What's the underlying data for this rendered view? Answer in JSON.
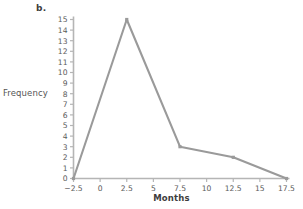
{
  "panel": {
    "label": "b."
  },
  "chart_data": {
    "type": "line",
    "title": "",
    "subtitle": "",
    "xlabel": "Months",
    "ylabel": "Frequency",
    "x": [
      -2.5,
      2.5,
      7.5,
      12.5,
      17.5
    ],
    "values": [
      0,
      15,
      3,
      2,
      0
    ],
    "series": [
      {
        "name": "Frequency",
        "x": [
          -2.5,
          2.5,
          7.5,
          12.5,
          17.5
        ],
        "values": [
          0,
          15,
          3,
          2,
          0
        ]
      }
    ],
    "xlim": [
      -2.5,
      17.5
    ],
    "ylim": [
      0,
      15
    ],
    "xticks": [
      -2.5,
      0,
      2.5,
      5,
      7.5,
      10,
      12.5,
      15,
      17.5
    ],
    "xtick_labels": [
      "−2.5",
      "0",
      "2.5",
      "5",
      "7.5",
      "10",
      "12.5",
      "15",
      "17.5"
    ],
    "yticks": [
      0,
      1,
      2,
      3,
      4,
      5,
      6,
      7,
      8,
      9,
      10,
      11,
      12,
      13,
      14,
      15
    ],
    "ytick_labels": [
      "0",
      "1",
      "2",
      "3",
      "4",
      "5",
      "6",
      "7",
      "8",
      "9",
      "10",
      "11",
      "12",
      "13",
      "14",
      "15"
    ],
    "grid": false,
    "legend": false,
    "legend_position": "none",
    "markers": true,
    "line_color": "#9a9a9a",
    "axis_color": "#b5b5b5",
    "text_color": "#5a5a5a",
    "background": "#ffffff"
  }
}
